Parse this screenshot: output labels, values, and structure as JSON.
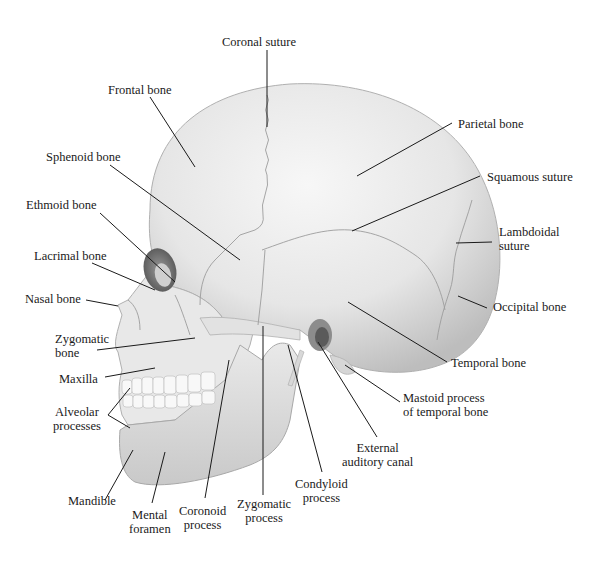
{
  "figure": {
    "bone_color": "#ececec",
    "shadow_color": "#b8b8b8",
    "leader_color": "#1a1a1a"
  },
  "labels": {
    "coronal_suture": "Coronal suture",
    "frontal_bone": "Frontal bone",
    "parietal_bone": "Parietal bone",
    "sphenoid_bone": "Sphenoid bone",
    "squamous_suture": "Squamous suture",
    "ethmoid_bone": "Ethmoid bone",
    "lambdoidal_suture_1": "Lambdoidal",
    "lambdoidal_suture_2": "suture",
    "lacrimal_bone": "Lacrimal bone",
    "nasal_bone": "Nasal bone",
    "occipital_bone": "Occipital bone",
    "zygomatic_bone_1": "Zygomatic",
    "zygomatic_bone_2": "bone",
    "temporal_bone": "Temporal  bone",
    "maxilla": "Maxilla",
    "mastoid_process_1": "Mastoid process",
    "mastoid_process_2": "of temporal bone",
    "alveolar_processes_1": "Alveolar",
    "alveolar_processes_2": "processes",
    "external_auditory_canal_1": "External",
    "external_auditory_canal_2": "auditory canal",
    "condyloid_process_1": "Condyloid",
    "condyloid_process_2": "process",
    "mandible": "Mandible",
    "mental_foramen_1": "Mental",
    "mental_foramen_2": "foramen",
    "coronoid_process_1": "Coronoid",
    "coronoid_process_2": "process",
    "zygomatic_process_1": "Zygomatic",
    "zygomatic_process_2": "process"
  }
}
